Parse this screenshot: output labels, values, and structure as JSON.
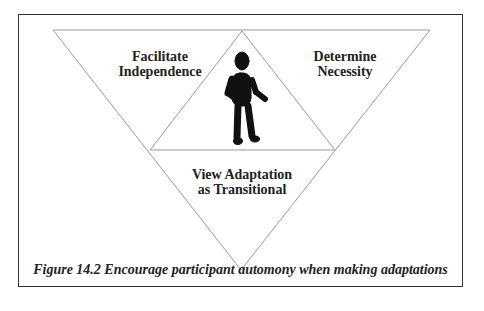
{
  "diagram": {
    "regions": {
      "top_left": {
        "line1": "Facilitate",
        "line2": "Independence"
      },
      "top_right": {
        "line1": "Determine",
        "line2": "Necessity"
      },
      "bottom": {
        "line1": "View Adaptation",
        "line2": "as Transitional"
      },
      "center": {
        "icon": "person-figure-icon"
      }
    },
    "caption": "Figure 14.2 Encourage participant automony when making adaptations",
    "colors": {
      "lines": "#999999",
      "text": "#222222",
      "figure": "#111111",
      "border": "#333333"
    }
  }
}
